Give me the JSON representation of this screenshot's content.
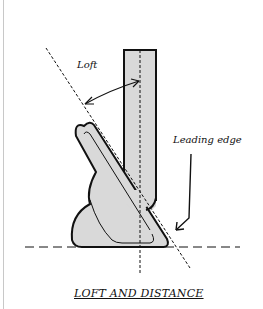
{
  "diagram": {
    "caption": "LOFT AND DISTANCE",
    "labels": {
      "loft": "Loft",
      "leading_edge": "Leading edge"
    },
    "colors": {
      "fill": "#d9d9d9",
      "stroke": "#111111",
      "background": "#ffffff"
    }
  }
}
